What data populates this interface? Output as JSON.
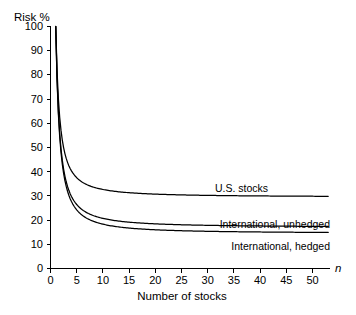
{
  "chart_data": {
    "type": "line",
    "title": "",
    "subtitle": "",
    "xlabel": "Number of stocks",
    "ylabel": "Risk %",
    "x_variable": "n",
    "xlim": [
      0,
      53
    ],
    "ylim": [
      0,
      100
    ],
    "x_ticks": [
      0,
      5,
      10,
      15,
      20,
      25,
      30,
      35,
      40,
      45,
      50
    ],
    "y_ticks": [
      0,
      10,
      20,
      30,
      40,
      50,
      60,
      70,
      80,
      90,
      100
    ],
    "grid": false,
    "legend_position": "inline-right-of-curves",
    "line_color": "#000000",
    "background_color": "#ffffff",
    "series": [
      {
        "name": "U.S. stocks",
        "asymptote": 29.5,
        "x": [
          1,
          2,
          3,
          4,
          5,
          6,
          7,
          8,
          9,
          10,
          12,
          14,
          16,
          18,
          20,
          25,
          30,
          35,
          40,
          45,
          50,
          53
        ],
        "values": [
          100,
          70,
          59.5,
          54.2,
          51.0,
          48.9,
          47.4,
          46.3,
          45.4,
          44.7,
          43.6,
          42.9,
          42.3,
          41.9,
          41.6,
          41.0,
          40.6,
          40.4,
          40.2,
          40.1,
          40.0,
          40.0
        ]
      },
      {
        "name": "International, unhedged",
        "asymptote": 17.0,
        "x": [
          1,
          2,
          3,
          4,
          5,
          6,
          7,
          8,
          9,
          10,
          12,
          14,
          16,
          18,
          20,
          25,
          30,
          35,
          40,
          45,
          50,
          53
        ],
        "values": [
          100,
          61.5,
          48.7,
          42.2,
          38.4,
          35.8,
          33.9,
          32.6,
          31.5,
          30.6,
          29.3,
          28.4,
          27.7,
          27.2,
          26.8,
          26.1,
          25.6,
          25.3,
          25.1,
          24.9,
          24.8,
          24.8
        ]
      },
      {
        "name": "International, hedged",
        "asymptote": 14.5,
        "x": [
          1,
          2,
          3,
          4,
          5,
          6,
          7,
          8,
          9,
          10,
          12,
          14,
          16,
          18,
          20,
          25,
          30,
          35,
          40,
          45,
          50,
          53
        ],
        "values": [
          100,
          59.0,
          45.3,
          38.5,
          34.4,
          31.6,
          29.7,
          28.2,
          27.1,
          26.2,
          24.8,
          23.9,
          23.2,
          22.6,
          22.2,
          21.5,
          21.0,
          20.7,
          20.5,
          20.3,
          20.2,
          20.2
        ]
      }
    ]
  },
  "axis": {
    "y_label": "Risk %",
    "x_label": "Number of stocks",
    "x_variable": "n",
    "y_tick_labels": [
      "0",
      "10",
      "20",
      "30",
      "40",
      "50",
      "60",
      "70",
      "80",
      "90",
      "100"
    ],
    "x_tick_labels": [
      "0",
      "5",
      "10",
      "15",
      "20",
      "25",
      "30",
      "35",
      "40",
      "45",
      "50"
    ]
  },
  "labels": {
    "us_stocks": "U.S. stocks",
    "international_unhedged": "International, unhedged",
    "international_hedged": "International, hedged"
  }
}
